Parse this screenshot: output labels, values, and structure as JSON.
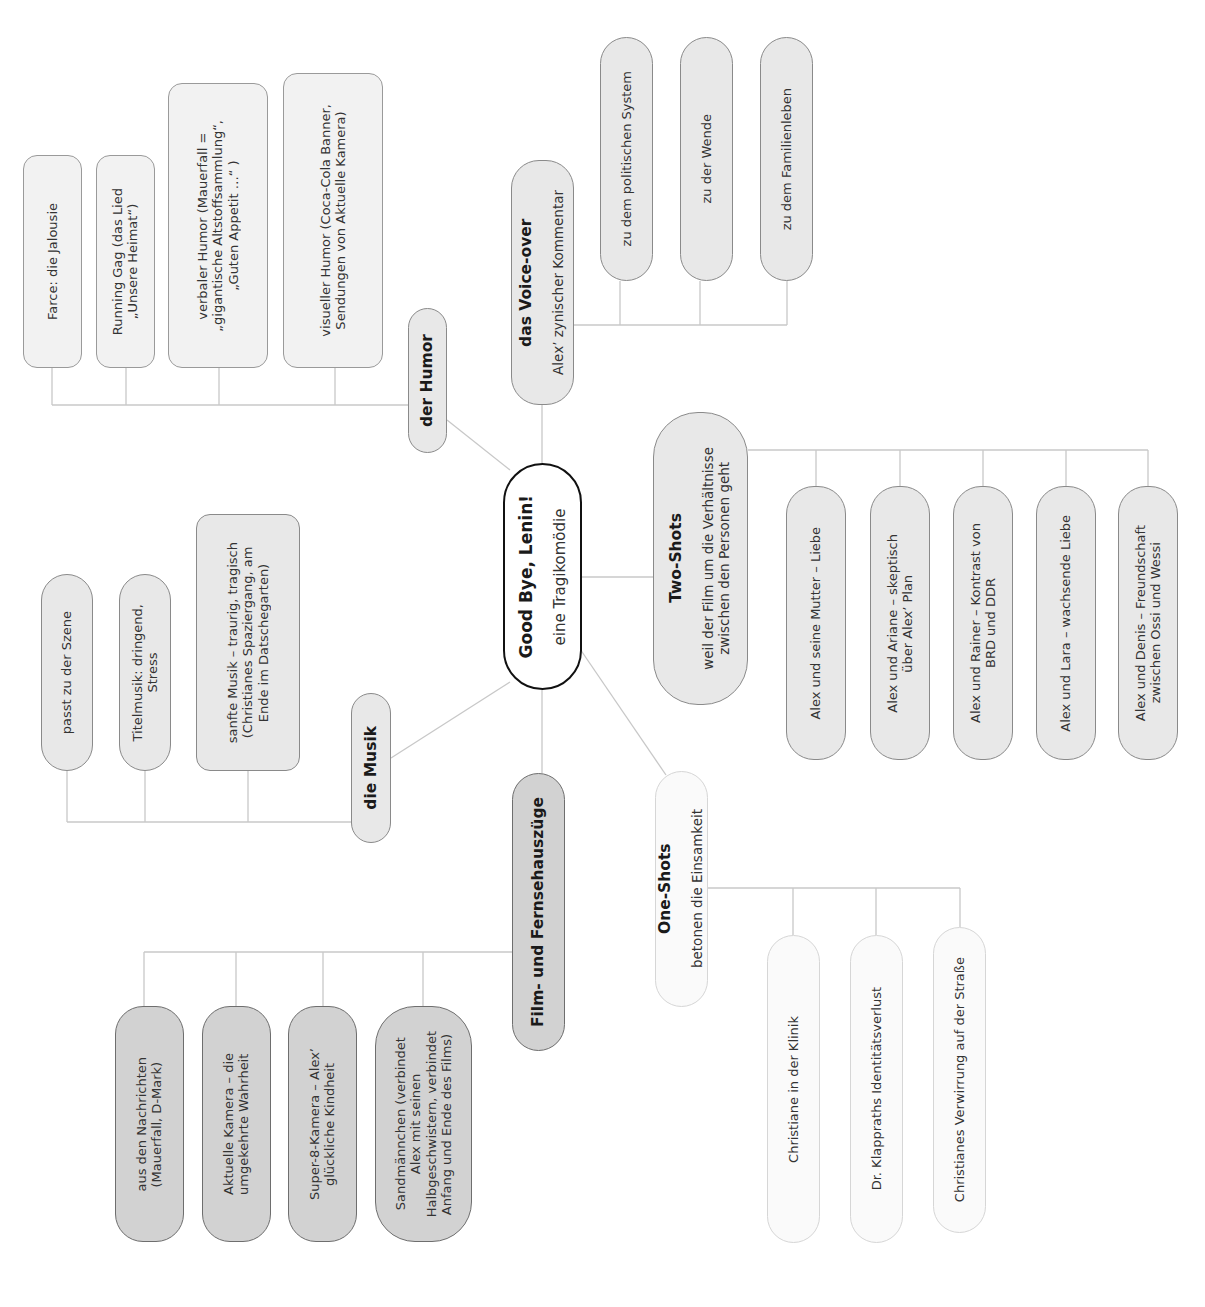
{
  "center": {
    "title": "Good Bye, Lenin!",
    "subtitle": "eine Tragikomödie"
  },
  "branches": {
    "humor": {
      "title": "der Humor",
      "children": [
        "Farce: die Jalousie",
        "Running Gag (das Lied\n„Unsere Heimat“)",
        "verbaler Humor (Mauerfall =\n„gigantische Altstoffsammlung“,\n„Guten Appetit …“ )",
        "visueller Humor (Coca-Cola Banner,\nSendungen von Aktuelle Kamera)"
      ]
    },
    "voiceover": {
      "title": "das Voice-over",
      "subtitle": "Alex’ zynischer Kommentar",
      "children": [
        "zu dem politischen System",
        "zu der Wende",
        "zu dem Familienleben"
      ]
    },
    "twoshots": {
      "title": "Two-Shots",
      "subtitle": "weil der Film um die Verhältnisse\nzwischen den Personen geht",
      "children": [
        "Alex und seine Mutter – Liebe",
        "Alex und Ariane – skeptisch\nüber Alex’ Plan",
        "Alex und Rainer – Kontrast von\nBRD und DDR",
        "Alex und Lara – wachsende Liebe",
        "Alex und Denis – Freundschaft\nzwischen Ossi und Wessi"
      ]
    },
    "musik": {
      "title": "die Musik",
      "children": [
        "passt zu der Szene",
        "Titelmusik: dringend,\nStress",
        "sanfte Musik – traurig, tragisch\n(Christianes Spaziergang, am\nEnde im Datschegarten)"
      ]
    },
    "film": {
      "title": "Film- und Fernsehauszüge",
      "children": [
        "aus den Nachrichten\n(Mauerfall, D-Mark)",
        "Aktuelle Kamera – die\numgekehrte Wahrheit",
        "Super-8-Kamera – Alex’\nglückliche Kindheit",
        "Sandmännchen (verbindet\nAlex mit seinen\nHalbgeschwistern, verbindet\nAnfang und Ende des Films)"
      ]
    },
    "oneshots": {
      "title": "One-Shots",
      "subtitle": "betonen die Einsamkeit",
      "children": [
        "Christiane in der Klinik",
        "Dr. Klappraths Identitätsverlust",
        "Christianes Verwirrung auf der Straße"
      ]
    }
  },
  "colors": {
    "line": "#c8c8c8",
    "center_border": "#111111",
    "node_fill_light": "#ececec",
    "node_fill_dark": "#d2d2d2",
    "node_fill_pale": "#fafafa"
  }
}
